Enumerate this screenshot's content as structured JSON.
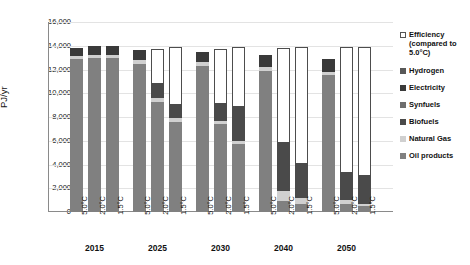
{
  "chart_data": {
    "type": "bar",
    "subtype": "stacked-bar-grouped",
    "title": "",
    "xlabel": "",
    "ylabel": "PJ/yr",
    "ylim": [
      0,
      16000
    ],
    "ytick_step": 2000,
    "yticks": [
      "16,000",
      "14,000",
      "12,000",
      "10,000",
      "8,000",
      "6,000",
      "4,000",
      "2,000",
      "0"
    ],
    "grid": true,
    "legend_position": "right",
    "groups": [
      "2015",
      "2025",
      "2030",
      "2040",
      "2050"
    ],
    "scenarios": [
      "5.0°C",
      "2.0°C",
      "1.5°C"
    ],
    "categories": [
      "2015 5.0°C",
      "2015 2.0°C",
      "2015 1.5°C",
      "2025 5.0°C",
      "2025 2.0°C",
      "2025 1.5°C",
      "2030 5.0°C",
      "2030 2.0°C",
      "2030 1.5°C",
      "2040 5.0°C",
      "2040 2.0°C",
      "2040 1.5°C",
      "2050 5.0°C",
      "2050 2.0°C",
      "2050 1.5°C"
    ],
    "series": [
      {
        "name": "Oil products",
        "color": "#808080",
        "values": [
          12900,
          13000,
          13000,
          12500,
          9300,
          7600,
          12300,
          7400,
          5700,
          11900,
          900,
          700,
          11500,
          700,
          500
        ]
      },
      {
        "name": "Natural Gas",
        "color": "#d0d0d0",
        "values": [
          250,
          250,
          250,
          280,
          300,
          300,
          300,
          300,
          300,
          300,
          900,
          500,
          300,
          300,
          200
        ]
      },
      {
        "name": "Biofuels",
        "color": "#4a4a4a",
        "values": [
          700,
          700,
          700,
          900,
          1300,
          1200,
          900,
          1500,
          2900,
          1000,
          4100,
          2900,
          1100,
          2400,
          2400
        ]
      },
      {
        "name": "Synfuels",
        "color": "#6e6e6e",
        "values": [
          0,
          0,
          0,
          0,
          0,
          0,
          0,
          0,
          0,
          0,
          0,
          0,
          0,
          0,
          0
        ]
      },
      {
        "name": "Electricity",
        "color": "#3a3a3a",
        "values": [
          0,
          0,
          0,
          0,
          0,
          0,
          0,
          0,
          0,
          0,
          0,
          0,
          0,
          0,
          0
        ]
      },
      {
        "name": "Hydrogen",
        "color": "#585858",
        "values": [
          0,
          0,
          0,
          0,
          0,
          0,
          0,
          0,
          0,
          0,
          0,
          0,
          0,
          0,
          0
        ]
      },
      {
        "name": "Efficiency (compared to 5.0°C)",
        "color": "#ffffff",
        "values": [
          0,
          0,
          0,
          0,
          2800,
          4800,
          0,
          4500,
          5000,
          0,
          7900,
          9800,
          0,
          10500,
          10800
        ]
      }
    ],
    "bar_totals": [
      13850,
      13950,
      13950,
      13680,
      13700,
      13900,
      13500,
      13700,
      13900,
      13200,
      13800,
      13900,
      13000,
      13900,
      13900
    ],
    "legend": [
      {
        "label": "Efficiency (compared to 5.0°C)",
        "color": "#ffffff",
        "outlined": true
      },
      {
        "label": "Hydrogen",
        "color": "#585858",
        "outlined": false
      },
      {
        "label": "Electricity",
        "color": "#3a3a3a",
        "outlined": false
      },
      {
        "label": "Synfuels",
        "color": "#6e6e6e",
        "outlined": false
      },
      {
        "label": "Biofuels",
        "color": "#4a4a4a",
        "outlined": false
      },
      {
        "label": "Natural Gas",
        "color": "#d0d0d0",
        "outlined": false
      },
      {
        "label": "Oil products",
        "color": "#808080",
        "outlined": false
      }
    ],
    "bars": [
      {
        "group": "2015",
        "scenario": "5.0°C",
        "x": 12,
        "segments": [
          {
            "name": "Oil products",
            "value": 12900,
            "color": "#808080"
          },
          {
            "name": "Natural Gas",
            "value": 250,
            "color": "#d0d0d0"
          },
          {
            "name": "Electricity",
            "value": 700,
            "color": "#3a3a3a"
          }
        ]
      },
      {
        "group": "2015",
        "scenario": "2.0°C",
        "x": 39,
        "segments": [
          {
            "name": "Oil products",
            "value": 13000,
            "color": "#808080"
          },
          {
            "name": "Natural Gas",
            "value": 250,
            "color": "#d0d0d0"
          },
          {
            "name": "Electricity",
            "value": 700,
            "color": "#3a3a3a"
          }
        ]
      },
      {
        "group": "2015",
        "scenario": "1.5°C",
        "x": 66,
        "segments": [
          {
            "name": "Oil products",
            "value": 13000,
            "color": "#808080"
          },
          {
            "name": "Natural Gas",
            "value": 250,
            "color": "#d0d0d0"
          },
          {
            "name": "Electricity",
            "value": 700,
            "color": "#3a3a3a"
          }
        ]
      },
      {
        "group": "2025",
        "scenario": "5.0°C",
        "x": 105,
        "segments": [
          {
            "name": "Oil products",
            "value": 12500,
            "color": "#808080"
          },
          {
            "name": "Natural Gas",
            "value": 280,
            "color": "#d0d0d0"
          },
          {
            "name": "Electricity",
            "value": 900,
            "color": "#3a3a3a"
          }
        ]
      },
      {
        "group": "2025",
        "scenario": "2.0°C",
        "x": 132,
        "segments": [
          {
            "name": "Oil products",
            "value": 9300,
            "color": "#808080"
          },
          {
            "name": "Natural Gas",
            "value": 300,
            "color": "#d0d0d0"
          },
          {
            "name": "Biofuels",
            "value": 1300,
            "color": "#4a4a4a"
          },
          {
            "name": "Efficiency",
            "value": 2800,
            "color": "#ffffff"
          }
        ]
      },
      {
        "group": "2025",
        "scenario": "1.5°C",
        "x": 159,
        "segments": [
          {
            "name": "Oil products",
            "value": 7600,
            "color": "#808080"
          },
          {
            "name": "Natural Gas",
            "value": 300,
            "color": "#d0d0d0"
          },
          {
            "name": "Biofuels",
            "value": 1200,
            "color": "#4a4a4a"
          },
          {
            "name": "Efficiency",
            "value": 4800,
            "color": "#ffffff"
          }
        ]
      },
      {
        "group": "2030",
        "scenario": "5.0°C",
        "x": 198,
        "segments": [
          {
            "name": "Oil products",
            "value": 12300,
            "color": "#808080"
          },
          {
            "name": "Natural Gas",
            "value": 300,
            "color": "#d0d0d0"
          },
          {
            "name": "Electricity",
            "value": 900,
            "color": "#3a3a3a"
          }
        ]
      },
      {
        "group": "2030",
        "scenario": "2.0°C",
        "x": 225,
        "segments": [
          {
            "name": "Oil products",
            "value": 7400,
            "color": "#808080"
          },
          {
            "name": "Natural Gas",
            "value": 300,
            "color": "#d0d0d0"
          },
          {
            "name": "Biofuels",
            "value": 1500,
            "color": "#4a4a4a"
          },
          {
            "name": "Efficiency",
            "value": 4500,
            "color": "#ffffff"
          }
        ]
      },
      {
        "group": "2030",
        "scenario": "1.5°C",
        "x": 252,
        "segments": [
          {
            "name": "Oil products",
            "value": 5700,
            "color": "#808080"
          },
          {
            "name": "Natural Gas",
            "value": 300,
            "color": "#d0d0d0"
          },
          {
            "name": "Biofuels",
            "value": 2900,
            "color": "#4a4a4a"
          },
          {
            "name": "Efficiency",
            "value": 5000,
            "color": "#ffffff"
          }
        ]
      },
      {
        "group": "2040",
        "scenario": "5.0°C",
        "x": 291,
        "segments": [
          {
            "name": "Oil products",
            "value": 11900,
            "color": "#808080"
          },
          {
            "name": "Natural Gas",
            "value": 300,
            "color": "#d0d0d0"
          },
          {
            "name": "Electricity",
            "value": 1000,
            "color": "#3a3a3a"
          }
        ]
      },
      {
        "group": "2040",
        "scenario": "2.0°C",
        "x": 318,
        "segments": [
          {
            "name": "Oil products",
            "value": 900,
            "color": "#808080"
          },
          {
            "name": "Natural Gas",
            "value": 900,
            "color": "#d0d0d0"
          },
          {
            "name": "Biofuels",
            "value": 4100,
            "color": "#4a4a4a"
          },
          {
            "name": "Efficiency",
            "value": 7900,
            "color": "#ffffff"
          }
        ]
      },
      {
        "group": "2040",
        "scenario": "1.5°C",
        "x": 345,
        "segments": [
          {
            "name": "Oil products",
            "value": 700,
            "color": "#808080"
          },
          {
            "name": "Natural Gas",
            "value": 500,
            "color": "#d0d0d0"
          },
          {
            "name": "Biofuels",
            "value": 2900,
            "color": "#4a4a4a"
          },
          {
            "name": "Efficiency",
            "value": 9800,
            "color": "#ffffff"
          }
        ]
      },
      {
        "group": "2050",
        "scenario": "5.0°C",
        "x": 384,
        "segments": [
          {
            "name": "Oil products",
            "value": 11500,
            "color": "#808080"
          },
          {
            "name": "Natural Gas",
            "value": 300,
            "color": "#d0d0d0"
          },
          {
            "name": "Electricity",
            "value": 1100,
            "color": "#3a3a3a"
          }
        ]
      },
      {
        "group": "2050",
        "scenario": "2.0°C",
        "x": 411,
        "segments": [
          {
            "name": "Oil products",
            "value": 700,
            "color": "#808080"
          },
          {
            "name": "Natural Gas",
            "value": 300,
            "color": "#d0d0d0"
          },
          {
            "name": "Biofuels",
            "value": 2400,
            "color": "#4a4a4a"
          },
          {
            "name": "Efficiency",
            "value": 10500,
            "color": "#ffffff"
          }
        ]
      },
      {
        "group": "2050",
        "scenario": "1.5°C",
        "x": 438,
        "segments": [
          {
            "name": "Oil products",
            "value": 500,
            "color": "#808080"
          },
          {
            "name": "Natural Gas",
            "value": 200,
            "color": "#d0d0d0"
          },
          {
            "name": "Biofuels",
            "value": 2400,
            "color": "#4a4a4a"
          },
          {
            "name": "Efficiency",
            "value": 10800,
            "color": "#ffffff"
          }
        ]
      }
    ]
  }
}
